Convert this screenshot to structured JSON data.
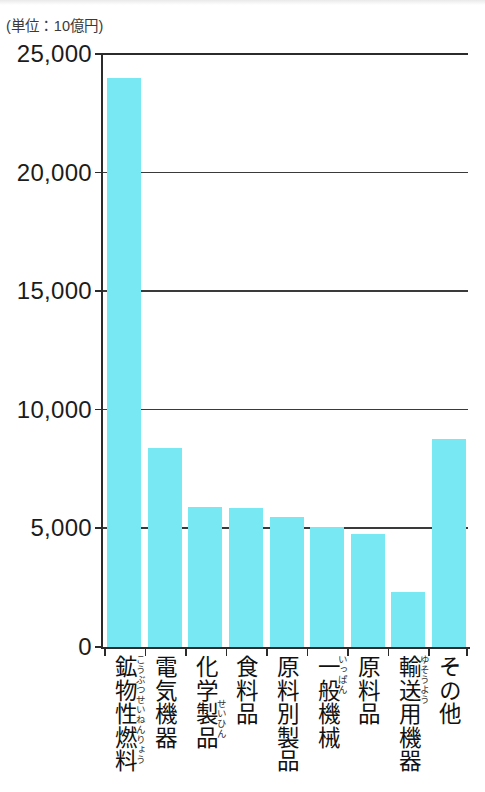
{
  "caption": {
    "unit_note": "(単位：10億円)"
  },
  "chart_data": {
    "type": "bar",
    "title": "",
    "subtitle": "",
    "xlabel": "",
    "ylabel": "",
    "unit_note": "(単位：10億円)",
    "categories": [
      "鉱物性燃料",
      "電気機器",
      "化学製品",
      "食料品",
      "原料別製品",
      "一般機械",
      "原料品",
      "輸送用機器",
      "その他"
    ],
    "category_furigana": [
      "こうぶつせいねんりょう",
      "",
      "せいひん",
      "",
      "",
      "いっぱん",
      "",
      "ゆそうよう",
      ""
    ],
    "values": [
      24000,
      8400,
      5900,
      5850,
      5500,
      5050,
      4750,
      2300,
      8750
    ],
    "ylim": [
      0,
      25000
    ],
    "yticks": [
      0,
      5000,
      10000,
      15000,
      20000,
      25000
    ],
    "ytick_labels": [
      "0",
      "5,000",
      "10,000",
      "15,000",
      "20,000",
      "25,000"
    ],
    "grid": true,
    "legend": "none",
    "bar_color": "#78e8f3",
    "axis_color": "#2b2b2b"
  }
}
